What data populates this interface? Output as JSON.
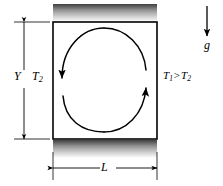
{
  "figure": {
    "type": "diagram",
    "background_color": "#ffffff",
    "line_color": "#000000",
    "wall_color_dark": "#4a4a4a",
    "wall_color_light": "#ffffff"
  },
  "enclosure": {
    "left": 53,
    "top": 22,
    "right": 157,
    "bottom": 139,
    "border_color": "#000000",
    "border_width": 1.6,
    "fill": "#ffffff"
  },
  "walls": {
    "top": {
      "name": "top-wall-hatch",
      "x": 53,
      "y": 4,
      "width": 104,
      "height": 18,
      "gradient": "dark-top-to-light-bottom"
    },
    "bottom": {
      "name": "bottom-wall-hatch",
      "x": 53,
      "y": 140,
      "width": 104,
      "height": 18,
      "gradient": "dark-top-to-light-bottom"
    }
  },
  "labels": {
    "height_dimension": "Y",
    "width_dimension": "L",
    "cold_wall_temperature": "T",
    "cold_wall_temperature_sub": "2",
    "hot_wall_symbol": "T",
    "hot_wall_sub": "1",
    "inequality_operator": ">",
    "cool_wall_symbol": "T",
    "cool_wall_sub": "2",
    "gravity": "g"
  },
  "dimension_lines": {
    "vertical": {
      "name": "y-dimension-line",
      "x": 24,
      "y_top": 22,
      "y_bottom": 139,
      "tick_top_x1": 14,
      "tick_top_x2": 50,
      "tick_bottom_x1": 14,
      "tick_bottom_x2": 50,
      "label_gap_top": 70,
      "label_gap_bottom": 88
    },
    "horizontal": {
      "name": "l-dimension-line",
      "y": 168,
      "x_left": 53,
      "x_right": 157,
      "tick_left_y1": 152,
      "tick_left_y2": 180,
      "tick_right_y1": 152,
      "tick_right_y2": 180,
      "label_gap_left": 100,
      "label_gap_right": 116
    }
  },
  "circulation": {
    "name": "convection-loop",
    "center_x": 104,
    "center_y": 80,
    "radius_x": 43,
    "radius_y": 52,
    "direction": "clockwise-descending-left-ascending-right",
    "left_arrow_head": {
      "x": 62,
      "y": 82,
      "points": "down"
    },
    "right_arrow_head": {
      "x": 146,
      "y": 78,
      "points": "up"
    }
  },
  "gravity_vector": {
    "name": "gravity-arrow",
    "x": 207,
    "y_start": 6,
    "y_end": 38,
    "direction": "down",
    "label_x": 205,
    "label_y": 40
  },
  "label_positions": {
    "Y": {
      "x": 16,
      "y": 72
    },
    "T2_left": {
      "x": 33,
      "y": 72
    },
    "T1_gt_T2": {
      "x": 164,
      "y": 72
    },
    "L": {
      "x": 100,
      "y": 161
    },
    "g": {
      "x": 204,
      "y": 40
    }
  }
}
